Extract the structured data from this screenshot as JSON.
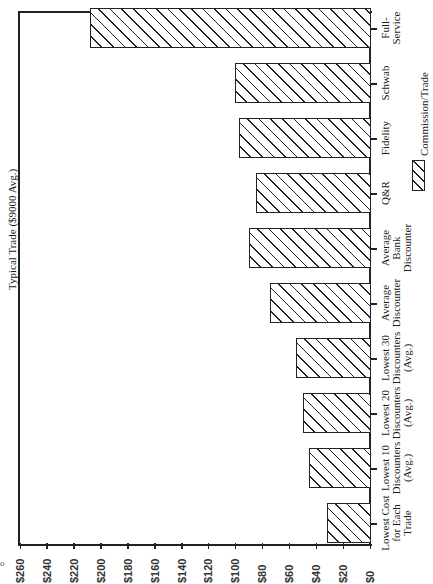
{
  "chart_data": {
    "type": "bar",
    "orientation": "rotated-90-clockwise (vertical bars drawn sideways; value axis runs horizontally along bottom, $0 at right)",
    "title": "Typical Trade ($9000 Avg.)",
    "xlabel": "",
    "ylabel": "",
    "categories": [
      "Lowest Cost for Each Trade",
      "Lowest 10 Discounters (Avg.)",
      "Lowest 20 Discounters (Avg.)",
      "Lowest 30 Discounters (Avg.)",
      "Average Discounter",
      "Average Bank Discounter",
      "Q&R",
      "Fidelity",
      "Schwab",
      "Full-Service"
    ],
    "series": [
      {
        "name": "Commission/Trade",
        "values": [
          32,
          45,
          50,
          55,
          74,
          90,
          85,
          97,
          100,
          208
        ]
      }
    ],
    "ylim": [
      0,
      260
    ],
    "y_ticks": [
      "$0",
      "$20",
      "$40",
      "$60",
      "$80",
      "$100",
      "$120",
      "$140",
      "$160",
      "$180",
      "$200",
      "$220",
      "$240",
      "$260"
    ],
    "grid": false,
    "legend": {
      "position": "right",
      "entries": [
        "Commission/Trade"
      ],
      "pattern": "diagonal-hatch"
    }
  },
  "labels": {
    "title": "Typical Trade ($9000 Avg.)",
    "legend": "Commission/Trade",
    "categories_display": [
      "Lowest Cost\nfor Each\nTrade",
      "Lowest 10\nDiscounters\n(Avg.)",
      "Lowest 20\nDiscounters\n(Avg.)",
      "Lowest 30\nDiscounters\n(Avg.)",
      "Average\nDiscounter",
      "Average\nBank\nDiscounter",
      "Q&R",
      "Fidelity",
      "Schwab",
      "Full-\nService"
    ],
    "artifact": "o"
  }
}
